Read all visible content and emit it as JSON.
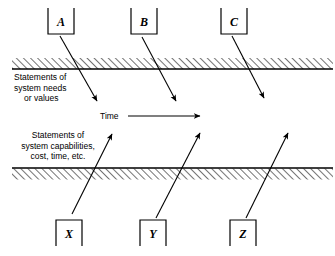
{
  "diagram": {
    "colors": {
      "stroke": "#000000",
      "background": "#ffffff",
      "hatch": "#000000"
    },
    "top_boxes": [
      {
        "label": "A",
        "x": 48,
        "y": 8,
        "w": 26,
        "h": 26
      },
      {
        "label": "B",
        "x": 131,
        "y": 8,
        "w": 26,
        "h": 26
      },
      {
        "label": "C",
        "x": 221,
        "y": 8,
        "w": 26,
        "h": 26
      }
    ],
    "bottom_boxes": [
      {
        "label": "X",
        "x": 56,
        "y": 220,
        "w": 26,
        "h": 26
      },
      {
        "label": "Y",
        "x": 140,
        "y": 220,
        "w": 26,
        "h": 26
      },
      {
        "label": "Z",
        "x": 230,
        "y": 220,
        "w": 26,
        "h": 26
      }
    ],
    "down_arrows": [
      {
        "name": "arrow-a",
        "x1": 60,
        "y1": 36,
        "x2": 97,
        "y2": 101
      },
      {
        "name": "arrow-b",
        "x1": 142,
        "y1": 37,
        "x2": 176,
        "y2": 101
      },
      {
        "name": "arrow-c",
        "x1": 232,
        "y1": 36,
        "x2": 264,
        "y2": 98
      }
    ],
    "up_arrows": [
      {
        "name": "arrow-x",
        "x1": 72,
        "y1": 214,
        "x2": 112,
        "y2": 134
      },
      {
        "name": "arrow-y",
        "x1": 156,
        "y1": 218,
        "x2": 200,
        "y2": 133
      },
      {
        "name": "arrow-z",
        "x1": 246,
        "y1": 218,
        "x2": 288,
        "y2": 133
      }
    ],
    "upper_boundary": {
      "name": "upper-boundary-band",
      "line_y": 69,
      "hatch_top": 58,
      "hatch_bottom": 69,
      "x_start": 12,
      "x_end": 333,
      "hatch_side": "above"
    },
    "lower_boundary": {
      "name": "lower-boundary-band",
      "line_y": 168,
      "hatch_top": 168,
      "hatch_bottom": 179,
      "x_start": 12,
      "x_end": 333,
      "hatch_side": "below"
    },
    "upper_caption": {
      "lines": [
        "Statements of",
        "system needs",
        "or values"
      ],
      "x": 14,
      "y": 80,
      "line_height": 10.5,
      "align": "start"
    },
    "lower_caption": {
      "lines": [
        "Statements of",
        "system capabilities,",
        "cost, time, etc."
      ],
      "x": 58,
      "y": 138,
      "line_height": 10.5,
      "align": "middle"
    },
    "time_axis": {
      "label": "Time",
      "label_x": 100,
      "label_y": 119,
      "arrow_x1": 128,
      "arrow_x2": 200,
      "arrow_y": 116
    }
  }
}
